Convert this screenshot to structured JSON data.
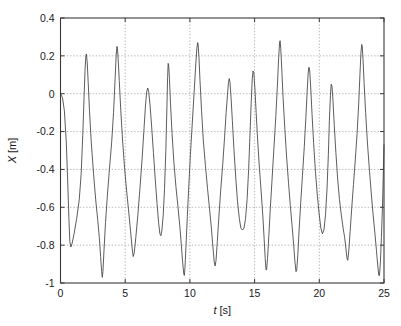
{
  "chart_data": {
    "type": "line",
    "title": "",
    "xlabel": "t [s]",
    "xlabel_var": "t",
    "xlabel_unit": "[s]",
    "ylabel": "X [m]",
    "ylabel_var": "X",
    "ylabel_unit": "[m]",
    "xlim": [
      0,
      25
    ],
    "ylim": [
      -1,
      0.4
    ],
    "xticks": [
      0,
      5,
      10,
      15,
      20,
      25
    ],
    "xtick_labels": [
      "0",
      "5",
      "10",
      "15",
      "20",
      "25"
    ],
    "yticks": [
      -1,
      -0.8,
      -0.6,
      -0.4,
      -0.2,
      0,
      0.2,
      0.4
    ],
    "ytick_labels": [
      "-1",
      "-0.8",
      "-0.6",
      "-0.4",
      "-0.2",
      "0",
      "0.2",
      "0.4"
    ],
    "grid": true,
    "grid_style": "dotted",
    "legend": null,
    "line_color": "#404040",
    "frame_color": "#3a3a3a",
    "background": "#ffffff",
    "series": [
      {
        "name": "X",
        "color": "#404040",
        "points": [
          [
            0.0,
            0.0
          ],
          [
            0.15,
            -0.02
          ],
          [
            0.3,
            -0.09
          ],
          [
            0.45,
            -0.26
          ],
          [
            0.55,
            -0.45
          ],
          [
            0.65,
            -0.66
          ],
          [
            0.72,
            -0.78
          ],
          [
            0.8,
            -0.81
          ],
          [
            0.9,
            -0.79
          ],
          [
            1.05,
            -0.74
          ],
          [
            1.25,
            -0.66
          ],
          [
            1.45,
            -0.56
          ],
          [
            1.6,
            -0.42
          ],
          [
            1.72,
            -0.22
          ],
          [
            1.82,
            -0.02
          ],
          [
            1.9,
            0.13
          ],
          [
            1.96,
            0.2
          ],
          [
            2.0,
            0.21
          ],
          [
            2.06,
            0.17
          ],
          [
            2.14,
            0.06
          ],
          [
            2.24,
            -0.09
          ],
          [
            2.38,
            -0.26
          ],
          [
            2.55,
            -0.42
          ],
          [
            2.72,
            -0.56
          ],
          [
            2.88,
            -0.67
          ],
          [
            3.0,
            -0.76
          ],
          [
            3.1,
            -0.86
          ],
          [
            3.18,
            -0.94
          ],
          [
            3.23,
            -0.97
          ],
          [
            3.28,
            -0.94
          ],
          [
            3.36,
            -0.83
          ],
          [
            3.48,
            -0.68
          ],
          [
            3.62,
            -0.54
          ],
          [
            3.78,
            -0.4
          ],
          [
            3.95,
            -0.26
          ],
          [
            4.1,
            -0.1
          ],
          [
            4.22,
            0.08
          ],
          [
            4.3,
            0.2
          ],
          [
            4.36,
            0.25
          ],
          [
            4.4,
            0.24
          ],
          [
            4.46,
            0.18
          ],
          [
            4.54,
            0.07
          ],
          [
            4.66,
            -0.09
          ],
          [
            4.8,
            -0.25
          ],
          [
            4.96,
            -0.4
          ],
          [
            5.12,
            -0.52
          ],
          [
            5.28,
            -0.63
          ],
          [
            5.42,
            -0.73
          ],
          [
            5.54,
            -0.82
          ],
          [
            5.62,
            -0.86
          ],
          [
            5.7,
            -0.84
          ],
          [
            5.82,
            -0.76
          ],
          [
            5.98,
            -0.64
          ],
          [
            6.14,
            -0.5
          ],
          [
            6.3,
            -0.35
          ],
          [
            6.44,
            -0.2
          ],
          [
            6.56,
            -0.07
          ],
          [
            6.66,
            0.01
          ],
          [
            6.74,
            0.03
          ],
          [
            6.82,
            0.01
          ],
          [
            6.92,
            -0.06
          ],
          [
            7.04,
            -0.17
          ],
          [
            7.18,
            -0.31
          ],
          [
            7.32,
            -0.45
          ],
          [
            7.46,
            -0.58
          ],
          [
            7.58,
            -0.68
          ],
          [
            7.68,
            -0.74
          ],
          [
            7.76,
            -0.75
          ],
          [
            7.84,
            -0.72
          ],
          [
            7.94,
            -0.64
          ],
          [
            8.04,
            -0.5
          ],
          [
            8.14,
            -0.3
          ],
          [
            8.22,
            -0.08
          ],
          [
            8.28,
            0.09
          ],
          [
            8.32,
            0.16
          ],
          [
            8.36,
            0.15
          ],
          [
            8.42,
            0.08
          ],
          [
            8.5,
            -0.05
          ],
          [
            8.62,
            -0.21
          ],
          [
            8.76,
            -0.36
          ],
          [
            8.92,
            -0.49
          ],
          [
            9.08,
            -0.6
          ],
          [
            9.22,
            -0.7
          ],
          [
            9.34,
            -0.8
          ],
          [
            9.44,
            -0.89
          ],
          [
            9.52,
            -0.95
          ],
          [
            9.57,
            -0.96
          ],
          [
            9.62,
            -0.92
          ],
          [
            9.7,
            -0.8
          ],
          [
            9.8,
            -0.65
          ],
          [
            9.92,
            -0.48
          ],
          [
            10.04,
            -0.32
          ],
          [
            10.18,
            -0.16
          ],
          [
            10.32,
            0.0
          ],
          [
            10.44,
            0.14
          ],
          [
            10.54,
            0.24
          ],
          [
            10.6,
            0.27
          ],
          [
            10.64,
            0.26
          ],
          [
            10.7,
            0.19
          ],
          [
            10.78,
            0.07
          ],
          [
            10.9,
            -0.09
          ],
          [
            11.04,
            -0.25
          ],
          [
            11.2,
            -0.38
          ],
          [
            11.36,
            -0.5
          ],
          [
            11.52,
            -0.61
          ],
          [
            11.66,
            -0.71
          ],
          [
            11.78,
            -0.81
          ],
          [
            11.88,
            -0.89
          ],
          [
            11.95,
            -0.91
          ],
          [
            12.02,
            -0.88
          ],
          [
            12.12,
            -0.78
          ],
          [
            12.24,
            -0.65
          ],
          [
            12.38,
            -0.51
          ],
          [
            12.54,
            -0.37
          ],
          [
            12.68,
            -0.23
          ],
          [
            12.8,
            -0.1
          ],
          [
            12.9,
            -0.01
          ],
          [
            12.98,
            0.06
          ],
          [
            13.04,
            0.08
          ],
          [
            13.1,
            0.06
          ],
          [
            13.18,
            -0.02
          ],
          [
            13.28,
            -0.14
          ],
          [
            13.4,
            -0.29
          ],
          [
            13.54,
            -0.44
          ],
          [
            13.68,
            -0.57
          ],
          [
            13.82,
            -0.66
          ],
          [
            13.94,
            -0.71
          ],
          [
            14.06,
            -0.72
          ],
          [
            14.18,
            -0.71
          ],
          [
            14.3,
            -0.66
          ],
          [
            14.42,
            -0.56
          ],
          [
            14.54,
            -0.4
          ],
          [
            14.64,
            -0.22
          ],
          [
            14.74,
            -0.04
          ],
          [
            14.82,
            0.08
          ],
          [
            14.88,
            0.12
          ],
          [
            14.94,
            0.11
          ],
          [
            15.02,
            0.03
          ],
          [
            15.12,
            -0.1
          ],
          [
            15.24,
            -0.25
          ],
          [
            15.38,
            -0.4
          ],
          [
            15.52,
            -0.53
          ],
          [
            15.64,
            -0.65
          ],
          [
            15.74,
            -0.77
          ],
          [
            15.82,
            -0.87
          ],
          [
            15.88,
            -0.93
          ],
          [
            15.93,
            -0.93
          ],
          [
            16.0,
            -0.87
          ],
          [
            16.1,
            -0.75
          ],
          [
            16.22,
            -0.6
          ],
          [
            16.36,
            -0.44
          ],
          [
            16.5,
            -0.28
          ],
          [
            16.64,
            -0.12
          ],
          [
            16.76,
            0.04
          ],
          [
            16.86,
            0.19
          ],
          [
            16.93,
            0.27
          ],
          [
            16.97,
            0.28
          ],
          [
            17.02,
            0.24
          ],
          [
            17.1,
            0.13
          ],
          [
            17.2,
            -0.02
          ],
          [
            17.34,
            -0.19
          ],
          [
            17.48,
            -0.34
          ],
          [
            17.62,
            -0.47
          ],
          [
            17.76,
            -0.59
          ],
          [
            17.9,
            -0.7
          ],
          [
            18.02,
            -0.8
          ],
          [
            18.12,
            -0.89
          ],
          [
            18.2,
            -0.94
          ],
          [
            18.26,
            -0.93
          ],
          [
            18.34,
            -0.85
          ],
          [
            18.44,
            -0.72
          ],
          [
            18.56,
            -0.58
          ],
          [
            18.7,
            -0.43
          ],
          [
            18.84,
            -0.28
          ],
          [
            18.96,
            -0.13
          ],
          [
            19.06,
            0.01
          ],
          [
            19.14,
            0.11
          ],
          [
            19.2,
            0.14
          ],
          [
            19.26,
            0.12
          ],
          [
            19.34,
            0.03
          ],
          [
            19.44,
            -0.11
          ],
          [
            19.56,
            -0.26
          ],
          [
            19.7,
            -0.41
          ],
          [
            19.84,
            -0.53
          ],
          [
            19.98,
            -0.63
          ],
          [
            20.12,
            -0.71
          ],
          [
            20.24,
            -0.74
          ],
          [
            20.36,
            -0.72
          ],
          [
            20.48,
            -0.64
          ],
          [
            20.6,
            -0.5
          ],
          [
            20.7,
            -0.32
          ],
          [
            20.78,
            -0.14
          ],
          [
            20.86,
            -0.01
          ],
          [
            20.92,
            0.05
          ],
          [
            20.98,
            0.04
          ],
          [
            21.06,
            -0.04
          ],
          [
            21.16,
            -0.17
          ],
          [
            21.28,
            -0.31
          ],
          [
            21.42,
            -0.45
          ],
          [
            21.56,
            -0.56
          ],
          [
            21.7,
            -0.64
          ],
          [
            21.84,
            -0.71
          ],
          [
            21.96,
            -0.76
          ],
          [
            22.06,
            -0.82
          ],
          [
            22.14,
            -0.87
          ],
          [
            22.2,
            -0.88
          ],
          [
            22.28,
            -0.83
          ],
          [
            22.38,
            -0.73
          ],
          [
            22.5,
            -0.61
          ],
          [
            22.64,
            -0.48
          ],
          [
            22.78,
            -0.35
          ],
          [
            22.92,
            -0.21
          ],
          [
            23.04,
            -0.06
          ],
          [
            23.14,
            0.1
          ],
          [
            23.22,
            0.22
          ],
          [
            23.28,
            0.26
          ],
          [
            23.32,
            0.25
          ],
          [
            23.38,
            0.18
          ],
          [
            23.46,
            0.06
          ],
          [
            23.58,
            -0.1
          ],
          [
            23.72,
            -0.26
          ],
          [
            23.88,
            -0.41
          ],
          [
            24.02,
            -0.53
          ],
          [
            24.16,
            -0.64
          ],
          [
            24.3,
            -0.74
          ],
          [
            24.42,
            -0.83
          ],
          [
            24.52,
            -0.91
          ],
          [
            24.6,
            -0.96
          ],
          [
            24.65,
            -0.96
          ],
          [
            24.72,
            -0.89
          ],
          [
            24.8,
            -0.76
          ],
          [
            24.88,
            -0.6
          ],
          [
            24.94,
            -0.44
          ],
          [
            25.0,
            -0.27
          ]
        ]
      }
    ]
  }
}
